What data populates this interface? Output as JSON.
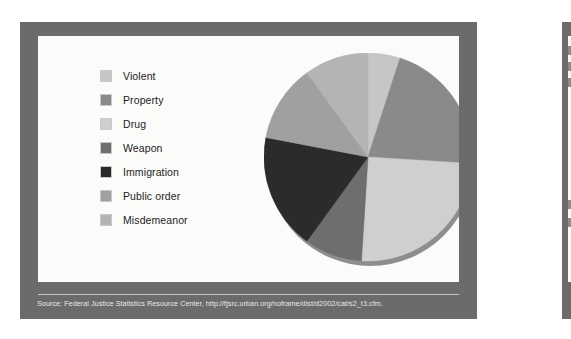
{
  "slide": {
    "frame_color": "#6b6b6b",
    "panel_color": "#fbfbfa"
  },
  "legend": {
    "items": [
      {
        "label": "Violent",
        "color": "#c6c6c6"
      },
      {
        "label": "Property",
        "color": "#8a8a8a"
      },
      {
        "label": "Drug",
        "color": "#cfcfcf"
      },
      {
        "label": "Weapon",
        "color": "#6e6e6e"
      },
      {
        "label": "Immigration",
        "color": "#2b2b2b"
      },
      {
        "label": "Public order",
        "color": "#a0a0a0"
      },
      {
        "label": "Misdemeanor",
        "color": "#b4b4b4"
      }
    ]
  },
  "footer": {
    "source": "Source: Federal Justice Statistics Resource Center, http://fjsrc.urban.org/noframe/dist/d2002/cat/s2_t3.cfm."
  },
  "chart_data": {
    "type": "pie",
    "title": "",
    "legend_position": "left",
    "start_angle": 0,
    "direction": "clockwise",
    "categories": [
      "Violent",
      "Property",
      "Drug",
      "Weapon",
      "Immigration",
      "Public order",
      "Misdemeanor"
    ],
    "values": [
      5,
      21,
      25,
      9,
      18,
      12,
      10
    ],
    "unit": "percent",
    "colors": [
      "#c6c6c6",
      "#8a8a8a",
      "#cfcfcf",
      "#6e6e6e",
      "#2b2b2b",
      "#a0a0a0",
      "#b4b4b4"
    ],
    "angles_deg": [
      18,
      75.6,
      90,
      32.4,
      64.8,
      43.2,
      36
    ]
  }
}
